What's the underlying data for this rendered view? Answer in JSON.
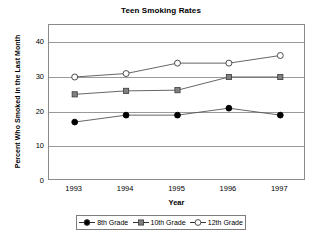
{
  "chart_data": {
    "type": "line",
    "title": "Teen Smoking Rates",
    "xlabel": "Year",
    "ylabel": "Percent Who Smoked in the Last Month",
    "categories": [
      "1993",
      "1994",
      "1995",
      "1996",
      "1997"
    ],
    "x": [
      1993,
      1994,
      1995,
      1996,
      1997
    ],
    "ylim": [
      0,
      45
    ],
    "yticks": [
      0,
      10,
      20,
      30,
      40
    ],
    "ytick_labels": [
      "0",
      "10",
      "20",
      "30",
      "40"
    ],
    "grid": true,
    "legend_position": "bottom",
    "series": [
      {
        "name": "8th Grade",
        "marker": "filled-circle",
        "color": "#000000",
        "values": [
          17,
          19,
          19,
          21,
          19
        ]
      },
      {
        "name": "10th Grade",
        "marker": "filled-square",
        "color": "#808080",
        "values": [
          25,
          26,
          26.2,
          30,
          30
        ]
      },
      {
        "name": "12th Grade",
        "marker": "open-circle",
        "color": "#ffffff",
        "values": [
          30,
          31,
          34,
          34,
          36.2
        ]
      }
    ]
  },
  "legend": {
    "items": [
      {
        "label": "8th Grade"
      },
      {
        "label": "10th Grade"
      },
      {
        "label": "12th Grade"
      }
    ]
  }
}
